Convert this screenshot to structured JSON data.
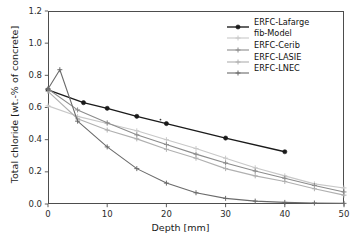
{
  "chart_data": {
    "type": "line",
    "title": "",
    "xlabel": "Depth [mm]",
    "ylabel": "Total chloride [wt.-% of concrete]",
    "xlim": [
      0,
      50
    ],
    "ylim": [
      0.0,
      1.2
    ],
    "xticks": [
      "0",
      "10",
      "20",
      "30",
      "40",
      "50"
    ],
    "xtick_values": [
      0,
      10,
      20,
      30,
      40,
      50
    ],
    "yticks": [
      "0.0",
      "0.2",
      "0.4",
      "0.6",
      "0.8",
      "1.0",
      "1.2"
    ],
    "ytick_values": [
      0.0,
      0.2,
      0.4,
      0.6,
      0.8,
      1.0,
      1.2
    ],
    "grid": false,
    "legend_position": "upper right",
    "series": [
      {
        "name": "ERFC-Lafarge",
        "color": "#1a1a1a",
        "marker": "circle",
        "x": [
          0,
          6,
          10,
          15,
          20,
          30,
          40
        ],
        "values": [
          0.71,
          0.63,
          0.595,
          0.545,
          0.5,
          0.41,
          0.325
        ]
      },
      {
        "name": "fib-Model",
        "color": "#c8c8c8",
        "marker": "plus",
        "x": [
          0,
          5,
          10,
          15,
          20,
          25,
          30,
          35,
          40,
          45,
          50
        ],
        "values": [
          0.61,
          0.545,
          0.5,
          0.455,
          0.4,
          0.345,
          0.285,
          0.225,
          0.175,
          0.125,
          0.1
        ]
      },
      {
        "name": "ERFC-Cerib",
        "color": "#8c8c8c",
        "marker": "plus",
        "x": [
          0,
          5,
          10,
          15,
          20,
          25,
          30,
          35,
          40,
          45,
          50
        ],
        "values": [
          0.715,
          0.585,
          0.505,
          0.43,
          0.37,
          0.31,
          0.255,
          0.205,
          0.16,
          0.115,
          0.075
        ]
      },
      {
        "name": "ERFC-LASIE",
        "color": "#b0b0b0",
        "marker": "plus",
        "x": [
          0,
          5,
          10,
          15,
          20,
          25,
          30,
          35,
          40,
          45,
          50
        ],
        "values": [
          0.7,
          0.53,
          0.46,
          0.405,
          0.34,
          0.285,
          0.22,
          0.175,
          0.14,
          0.095,
          0.055
        ]
      },
      {
        "name": "ERFC-LNEC",
        "color": "#6b6b6b",
        "marker": "plus",
        "x": [
          0,
          2,
          5,
          10,
          15,
          20,
          25,
          30,
          35,
          40,
          45,
          50
        ],
        "values": [
          0.715,
          0.835,
          0.515,
          0.355,
          0.22,
          0.13,
          0.07,
          0.035,
          0.018,
          0.01,
          0.006,
          0.004
        ]
      }
    ],
    "annotations": [
      {
        "name": "stray-marker",
        "x": 19.0,
        "y": 0.525
      }
    ]
  }
}
